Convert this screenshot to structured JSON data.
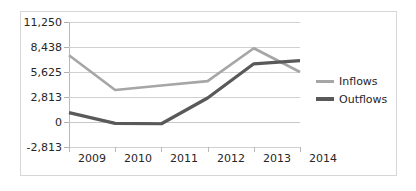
{
  "chart_data": {
    "type": "line",
    "title": "",
    "xlabel": "",
    "ylabel": "",
    "x": [
      "2009",
      "2010",
      "2011",
      "2012",
      "2013",
      "2014"
    ],
    "categories": [
      "2009",
      "2010",
      "2011",
      "2012",
      "2013",
      "2014"
    ],
    "series": [
      {
        "name": "Inflows",
        "color": "#a6a6a6",
        "values": [
          7500,
          3600,
          4100,
          4600,
          8300,
          5625
        ]
      },
      {
        "name": "Outflows",
        "color": "#595959",
        "values": [
          1050,
          -150,
          -200,
          2700,
          6550,
          6900
        ]
      }
    ],
    "ylim": [
      -2813,
      11250
    ],
    "ytick_values": [
      11250,
      8438,
      5625,
      2813,
      0,
      -2813
    ],
    "ytick_labels": [
      "11,250",
      "8,438",
      "5,625",
      "2,813",
      "0",
      "-2,813"
    ],
    "xtick_labels": [
      "2009",
      "2010",
      "2011",
      "2012",
      "2013",
      "2014"
    ],
    "grid": true,
    "grid_axis": "y",
    "legend": [
      "Inflows",
      "Outflows"
    ],
    "legend_position": "right"
  },
  "legend": {
    "items": [
      {
        "label": "Inflows",
        "color": "#a6a6a6"
      },
      {
        "label": "Outflows",
        "color": "#595959"
      }
    ]
  },
  "colors": {
    "inflows": "#a6a6a6",
    "outflows": "#595959",
    "gridline": "#d0d0d0",
    "axis": "#b8b8b8",
    "frame": "#d6d6d6",
    "text": "#262626",
    "background": "#ffffff"
  }
}
